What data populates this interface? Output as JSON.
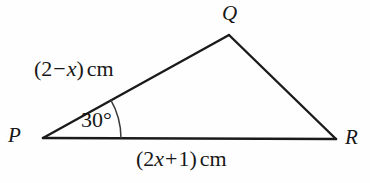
{
  "diagram": {
    "kind": "triangle-geometry-figure",
    "background_color": "#fefefe",
    "stroke_color": "#1a1a1a",
    "vertices": {
      "p": {
        "label": "P",
        "x": 43,
        "y": 138
      },
      "q": {
        "label": "Q",
        "x": 229,
        "y": 35
      },
      "r": {
        "label": "R",
        "x": 336,
        "y": 139
      }
    },
    "sides": {
      "pq": {
        "label_parts": {
          "open": "(2",
          "operator": "−",
          "variable": "x",
          "close": ")",
          "unit": "cm"
        },
        "label_text": "(2 − x)cm"
      },
      "pr": {
        "label_parts": {
          "open": "(2",
          "variable": "x",
          "operator": "+",
          "constant": "1",
          "close": ")",
          "unit": "cm"
        },
        "label_text": "(2x + 1)cm"
      },
      "qr": {
        "label_text": ""
      }
    },
    "angles": {
      "at_p": {
        "label": "30°",
        "value": 30,
        "unit": "degrees",
        "arc_radius": 78
      }
    }
  }
}
